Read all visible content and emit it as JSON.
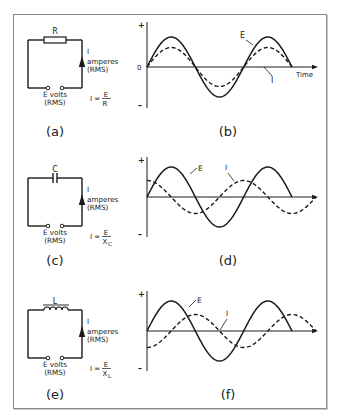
{
  "panels": [
    {
      "id": "a",
      "caption": "(a)",
      "type": "circuit",
      "component": "resistor",
      "component_label": "R",
      "current_label": [
        "I",
        "amperes",
        "(RMS)"
      ],
      "source_label": [
        "E volts",
        "(RMS)"
      ],
      "formula": {
        "lhs": "I =",
        "num": "E",
        "den": "R",
        "den_sub": ""
      }
    },
    {
      "id": "b",
      "caption": "(b)",
      "type": "waveform",
      "axis_labels": {
        "plus": "+",
        "zero": "0",
        "minus": "–",
        "x": "Time"
      },
      "curve_labels": {
        "E": "E",
        "I": "I"
      },
      "relation": "in-phase"
    },
    {
      "id": "c",
      "caption": "(c)",
      "type": "circuit",
      "component": "capacitor",
      "component_label": "C",
      "current_label": [
        "I",
        "amperes",
        "(RMS)"
      ],
      "source_label": [
        "E volts",
        "(RMS)"
      ],
      "formula": {
        "lhs": "I =",
        "num": "E",
        "den": "X",
        "den_sub": "C"
      }
    },
    {
      "id": "d",
      "caption": "(d)",
      "type": "waveform",
      "axis_labels": {
        "plus": "+",
        "zero": "",
        "minus": "–",
        "x": ""
      },
      "curve_labels": {
        "E": "E",
        "I": "I"
      },
      "relation": "I leads E by 90°"
    },
    {
      "id": "e",
      "caption": "(e)",
      "type": "circuit",
      "component": "inductor",
      "component_label": "L",
      "current_label": [
        "I",
        "amperes",
        "(RMS)"
      ],
      "source_label": [
        "E volts",
        "(RMS)"
      ],
      "formula": {
        "lhs": "I =",
        "num": "E",
        "den": "X",
        "den_sub": "L"
      }
    },
    {
      "id": "f",
      "caption": "(f)",
      "type": "waveform",
      "axis_labels": {
        "plus": "+",
        "zero": "",
        "minus": "–",
        "x": ""
      },
      "curve_labels": {
        "E": "E",
        "I": "I"
      },
      "relation": "I lags E by 90°"
    }
  ],
  "waveforms": {
    "E": {
      "cycles": 1.5,
      "amplitude": 1.0,
      "phase_deg": 0,
      "style": "solid"
    },
    "I_b": {
      "cycles": 1.5,
      "amplitude": 0.65,
      "phase_deg": 0,
      "style": "dashed"
    },
    "I_d": {
      "cycles": 1.75,
      "amplitude": 0.55,
      "phase_deg": 90,
      "style": "dashed"
    },
    "I_f": {
      "cycles": 1.75,
      "amplitude": 0.55,
      "phase_deg": -90,
      "style": "dashed"
    }
  },
  "colors": {
    "ink": "#1a1a1a",
    "frame": "#8a8a8a"
  }
}
